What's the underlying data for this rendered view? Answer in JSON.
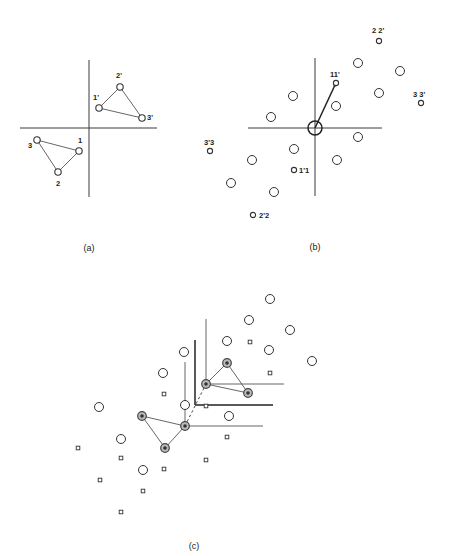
{
  "figure": {
    "panel_a": {
      "caption": "(a)",
      "axes": {
        "cx": 89,
        "cy": 128,
        "x1": 20,
        "x2": 157,
        "y1": 60,
        "y2": 197
      },
      "points": [
        {
          "id": "1",
          "x": 79,
          "y": 151,
          "label": "1",
          "lx": 80,
          "ly": 143
        },
        {
          "id": "2",
          "x": 58,
          "y": 172,
          "label": "2",
          "lx": 58,
          "ly": 186
        },
        {
          "id": "3",
          "x": 37,
          "y": 140,
          "label": "3",
          "lx": 30,
          "ly": 148
        },
        {
          "id": "1p",
          "x": 99,
          "y": 108,
          "label": "1'",
          "lx": 96,
          "ly": 100
        },
        {
          "id": "2p",
          "x": 120,
          "y": 87,
          "label": "2'",
          "lx": 119,
          "ly": 78
        },
        {
          "id": "3p",
          "x": 142,
          "y": 118,
          "label": "3'",
          "lx": 150,
          "ly": 120
        }
      ],
      "triangles": [
        [
          "1",
          "2",
          "3"
        ],
        [
          "1p",
          "2p",
          "3p"
        ]
      ]
    },
    "panel_b": {
      "caption": "(b)",
      "axes": {
        "cx": 315,
        "cy": 128,
        "x1": 248,
        "x2": 382,
        "y1": 58,
        "y2": 196
      },
      "origin_ring": {
        "x": 315,
        "y": 128,
        "r": 7
      },
      "vector": {
        "x1": 315,
        "y1": 128,
        "x2": 335,
        "y2": 85
      },
      "big_circles": [
        [
          358,
          63
        ],
        [
          400,
          71
        ],
        [
          379,
          93
        ],
        [
          336,
          106
        ],
        [
          293,
          96
        ],
        [
          271,
          117
        ],
        [
          358,
          137
        ],
        [
          337,
          160
        ],
        [
          294,
          149
        ],
        [
          252,
          160
        ],
        [
          231,
          183
        ],
        [
          274,
          192
        ]
      ],
      "small_circles": [
        {
          "x": 379,
          "y": 41,
          "label": "2 2'",
          "lx": 372,
          "ly": 33
        },
        {
          "x": 336,
          "y": 83,
          "label": "11'",
          "lx": 330,
          "ly": 77
        },
        {
          "x": 421,
          "y": 103,
          "label": "3 3'",
          "lx": 413,
          "ly": 97
        },
        {
          "x": 210,
          "y": 151,
          "label": "3'3",
          "lx": 204,
          "ly": 145
        },
        {
          "x": 294,
          "y": 170,
          "label": "1'1",
          "lx": 299,
          "ly": 173
        },
        {
          "x": 253,
          "y": 215,
          "label": "2'2",
          "lx": 259,
          "ly": 218
        }
      ]
    },
    "panel_c": {
      "caption": "(c)",
      "big_circles": [
        [
          270,
          299
        ],
        [
          249,
          320
        ],
        [
          290,
          330
        ],
        [
          227,
          341
        ],
        [
          269,
          350
        ],
        [
          312,
          361
        ],
        [
          184,
          352
        ],
        [
          163,
          373
        ],
        [
          185,
          405
        ],
        [
          229,
          416
        ],
        [
          99,
          407
        ],
        [
          121,
          439
        ],
        [
          143,
          470
        ]
      ],
      "squares": [
        [
          250,
          342
        ],
        [
          270,
          373
        ],
        [
          164,
          394
        ],
        [
          206,
          406
        ],
        [
          227,
          437
        ],
        [
          206,
          460
        ],
        [
          78,
          448
        ],
        [
          121,
          458
        ],
        [
          164,
          469
        ],
        [
          100,
          480
        ],
        [
          143,
          491
        ],
        [
          121,
          512
        ]
      ],
      "triangle_upper": {
        "A": [
          206,
          384
        ],
        "B": [
          227,
          363
        ],
        "C": [
          248,
          393
        ]
      },
      "triangle_lower": {
        "D": [
          185,
          426
        ],
        "E": [
          142,
          416
        ],
        "F": [
          165,
          448
        ]
      },
      "axes_upper": {
        "vx": 206,
        "vy1": 319,
        "hy": 384,
        "hx2": 284
      },
      "axes_corner": {
        "vx": 195,
        "vy1": 340,
        "hy": 405,
        "hx2": 273
      },
      "axes_lower": {
        "vx": 185,
        "vy1": 362,
        "hy": 426,
        "hx2": 263
      },
      "dashed": {
        "x1": 185,
        "y1": 426,
        "x2": 206,
        "y2": 384
      }
    },
    "captions": {
      "a": {
        "text": "(a)",
        "x": 89,
        "y": 251
      },
      "b": {
        "text": "(b)",
        "x": 315,
        "y": 250
      },
      "c": {
        "text": "(c)",
        "x": 194,
        "y": 549
      }
    }
  }
}
